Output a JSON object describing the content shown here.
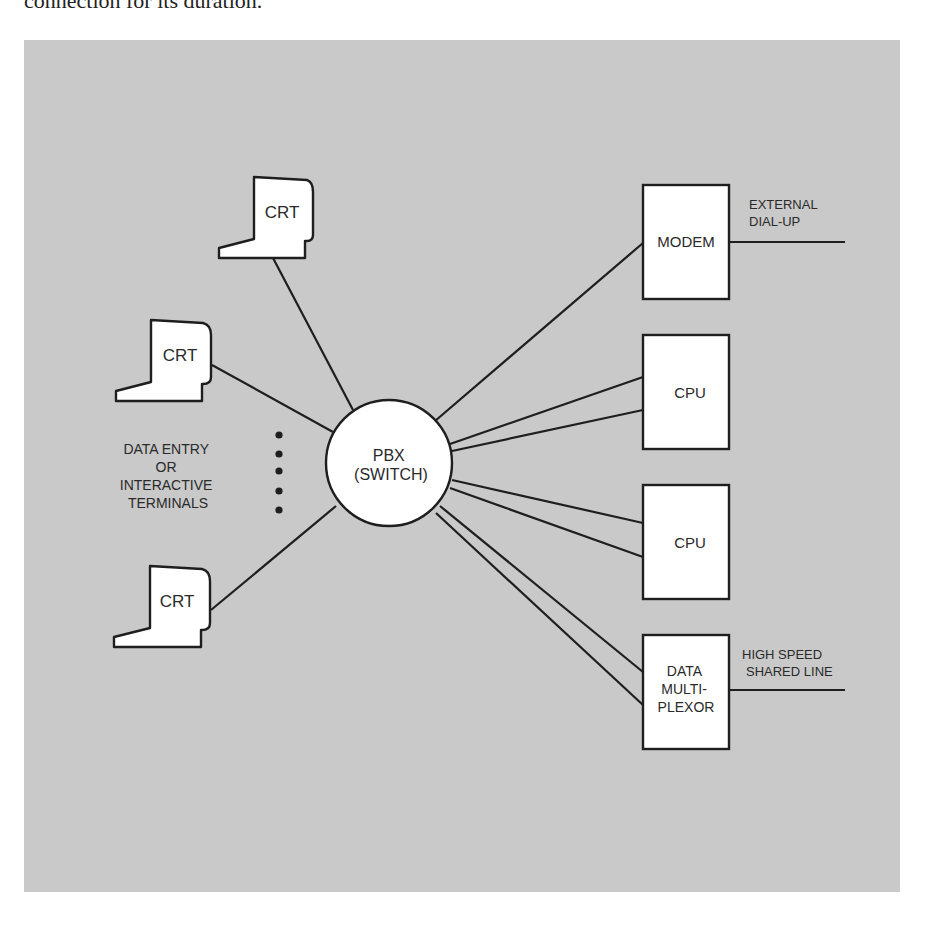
{
  "caption": {
    "text_fragment": "connection for its duration."
  },
  "diagram": {
    "background_color": "#c9c9c9",
    "line_color": "#1e1e1e",
    "node_fill": "#ffffff",
    "hub": {
      "line1": "PBX",
      "line2": "(SWITCH)"
    },
    "terminals": [
      {
        "label": "CRT"
      },
      {
        "label": "CRT"
      },
      {
        "label": "CRT"
      }
    ],
    "terminal_group_label": {
      "line1": "DATA ENTRY",
      "line2": "OR",
      "line3": "INTERACTIVE",
      "line4": "TERMINALS"
    },
    "devices": [
      {
        "lines": [
          "MODEM"
        ]
      },
      {
        "lines": [
          "CPU"
        ]
      },
      {
        "lines": [
          "CPU"
        ]
      },
      {
        "lines": [
          "DATA",
          "MULTI-",
          "PLEXOR"
        ]
      }
    ],
    "external_links": [
      {
        "line1": "EXTERNAL",
        "line2": "DIAL-UP"
      },
      {
        "line1": "HIGH SPEED",
        "line2": "SHARED LINE"
      }
    ]
  }
}
